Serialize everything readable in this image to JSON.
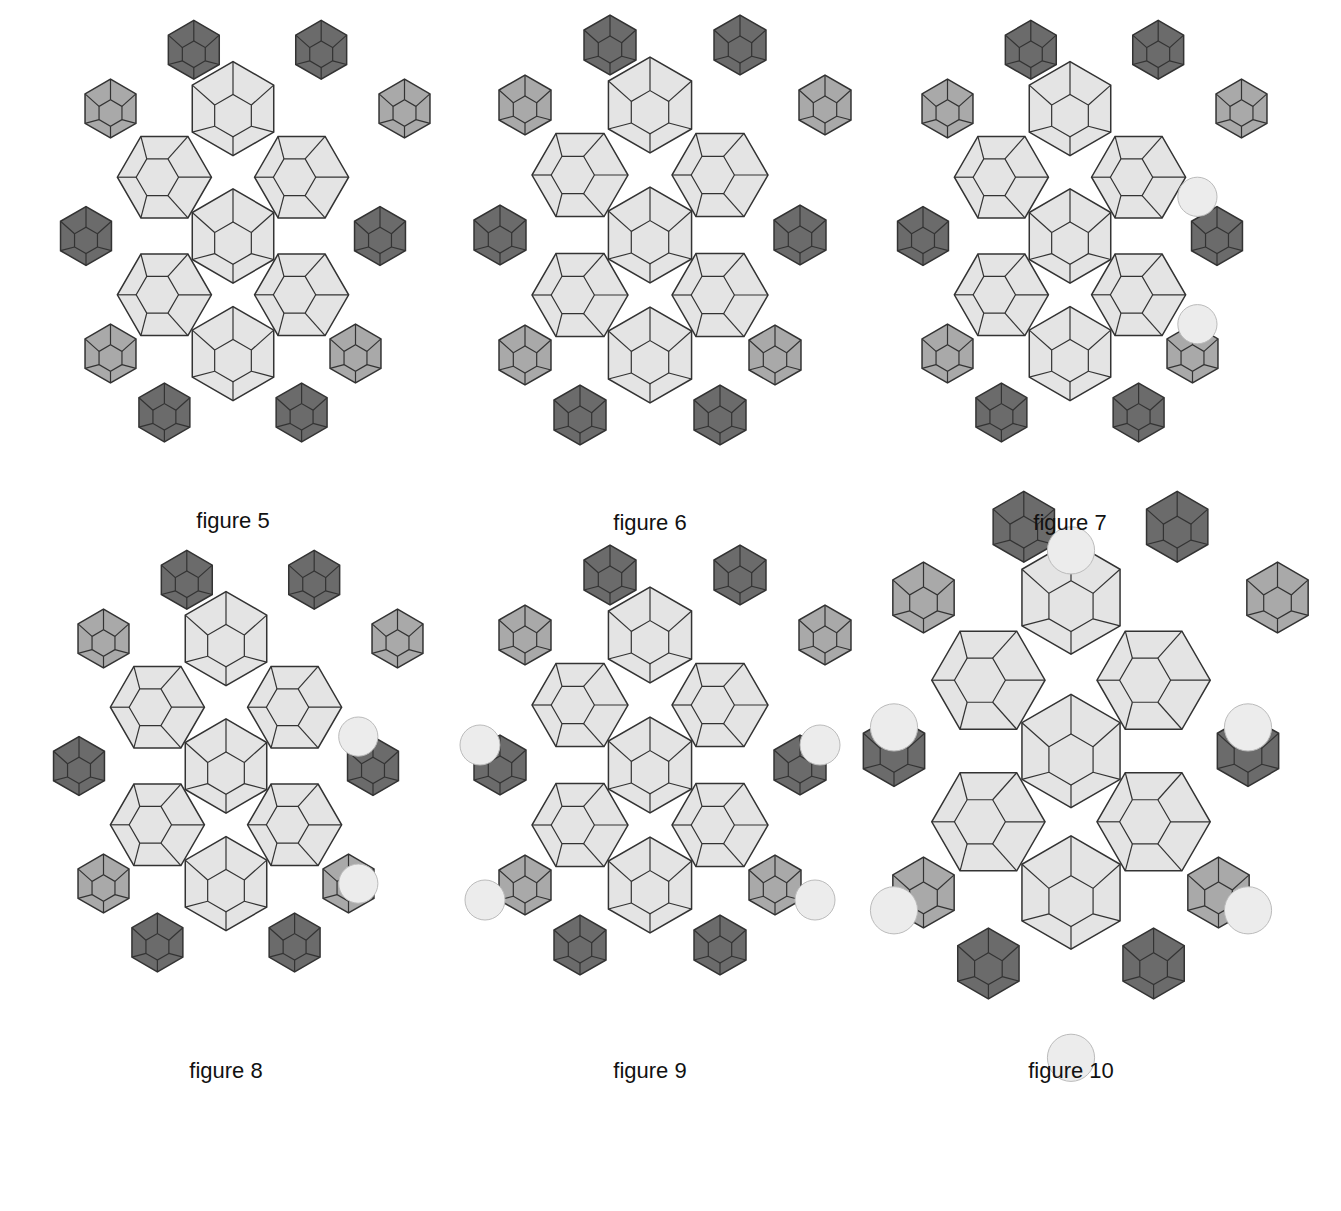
{
  "colors": {
    "dark": "#6b6b6b",
    "medium": "#a9a9a9",
    "light": "#e4e4e4",
    "pearl": "#ececec",
    "stroke": "#333333",
    "thread": "#9a9a9a"
  },
  "figures": [
    {
      "id": "fig5",
      "caption": "figure 5",
      "cx": 233,
      "cy": 520
    },
    {
      "id": "fig6",
      "caption": "figure 6",
      "cx": 650,
      "cy": 522
    },
    {
      "id": "fig7",
      "caption": "figure 7",
      "cx": 1070,
      "cy": 522
    },
    {
      "id": "fig8",
      "caption": "figure 8",
      "cx": 226,
      "cy": 1070
    },
    {
      "id": "fig9",
      "caption": "figure 9",
      "cx": 650,
      "cy": 1070
    },
    {
      "id": "fig10",
      "caption": "figure 10",
      "cx": 1071,
      "cy": 1070
    }
  ]
}
